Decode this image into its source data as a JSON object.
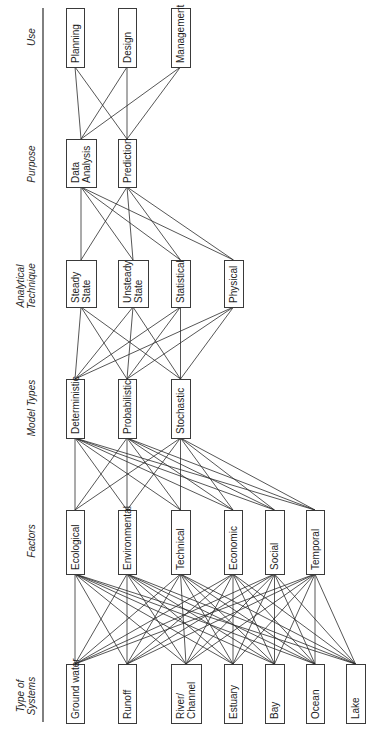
{
  "diagram": {
    "orientation": "rotated-90-ccw",
    "axis_line": {
      "x": 43,
      "y1": 8,
      "y2": 722
    },
    "tiers": [
      {
        "id": "use",
        "label_lines": [
          "Use"
        ],
        "label_center_y": 37,
        "box_top": 8,
        "box_bottom": 67,
        "nodes": [
          {
            "id": "planning",
            "lines": [
              "Planning"
            ],
            "x": 66,
            "w": 18
          },
          {
            "id": "design",
            "lines": [
              "Design"
            ],
            "x": 118,
            "w": 18
          },
          {
            "id": "management",
            "lines": [
              "Management"
            ],
            "x": 171,
            "w": 19
          }
        ]
      },
      {
        "id": "purpose",
        "label_lines": [
          "Purpose"
        ],
        "label_center_y": 164,
        "box_top": 139,
        "box_bottom": 187,
        "nodes": [
          {
            "id": "data-analysis",
            "lines": [
              "Data",
              "Analysis"
            ],
            "x": 66,
            "w": 30
          },
          {
            "id": "prediction",
            "lines": [
              "Prediction"
            ],
            "x": 118,
            "w": 18
          }
        ]
      },
      {
        "id": "analytical-technique",
        "label_lines": [
          "Analytical",
          "Technique"
        ],
        "label_center_y": 286,
        "box_top": 260,
        "box_bottom": 307,
        "nodes": [
          {
            "id": "steady-state",
            "lines": [
              "Steady",
              "State"
            ],
            "x": 66,
            "w": 30
          },
          {
            "id": "unsteady-state",
            "lines": [
              "Unsteady",
              "State"
            ],
            "x": 118,
            "w": 30
          },
          {
            "id": "statistical",
            "lines": [
              "Statistical"
            ],
            "x": 171,
            "w": 19
          },
          {
            "id": "physical",
            "lines": [
              "Physical"
            ],
            "x": 224,
            "w": 19
          }
        ]
      },
      {
        "id": "model-types",
        "label_lines": [
          "Model Types"
        ],
        "label_center_y": 408,
        "box_top": 379,
        "box_bottom": 438,
        "nodes": [
          {
            "id": "deterministic",
            "lines": [
              "Deterministic"
            ],
            "x": 66,
            "w": 18
          },
          {
            "id": "probabilistic",
            "lines": [
              "Probabilistic"
            ],
            "x": 118,
            "w": 18
          },
          {
            "id": "stochastic",
            "lines": [
              "Stochastic"
            ],
            "x": 171,
            "w": 19
          }
        ]
      },
      {
        "id": "factors",
        "label_lines": [
          "Factors"
        ],
        "label_center_y": 541,
        "box_top": 510,
        "box_bottom": 574,
        "nodes": [
          {
            "id": "ecological",
            "lines": [
              "Ecological"
            ],
            "x": 66,
            "w": 18
          },
          {
            "id": "environmental",
            "lines": [
              "Environmental"
            ],
            "x": 118,
            "w": 18
          },
          {
            "id": "technical",
            "lines": [
              "Technical"
            ],
            "x": 171,
            "w": 19
          },
          {
            "id": "economic",
            "lines": [
              "Economic"
            ],
            "x": 224,
            "w": 18
          },
          {
            "id": "social",
            "lines": [
              "Social"
            ],
            "x": 265,
            "w": 19
          },
          {
            "id": "temporal",
            "lines": [
              "Temporal"
            ],
            "x": 306,
            "w": 18
          }
        ]
      },
      {
        "id": "type-of-systems",
        "label_lines": [
          "Type of",
          "Systems"
        ],
        "label_center_y": 696,
        "box_top": 664,
        "box_bottom": 723,
        "nodes": [
          {
            "id": "ground-water",
            "lines": [
              "Ground water"
            ],
            "x": 66,
            "w": 18
          },
          {
            "id": "runoff",
            "lines": [
              "Runoff"
            ],
            "x": 118,
            "w": 18
          },
          {
            "id": "river-channel",
            "lines": [
              "River/",
              "Channel"
            ],
            "x": 171,
            "w": 30
          },
          {
            "id": "estuary",
            "lines": [
              "Estuary"
            ],
            "x": 224,
            "w": 18
          },
          {
            "id": "bay",
            "lines": [
              "Bay"
            ],
            "x": 265,
            "w": 19
          },
          {
            "id": "ocean",
            "lines": [
              "Ocean"
            ],
            "x": 306,
            "w": 18
          },
          {
            "id": "lake",
            "lines": [
              "Lake"
            ],
            "x": 346,
            "w": 19
          }
        ]
      }
    ],
    "connections": "each node is linked to every node in the adjacent tier (complete bipartite between consecutive tiers)"
  }
}
